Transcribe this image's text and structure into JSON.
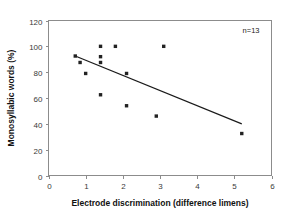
{
  "chart_data": {
    "type": "scatter",
    "title": "",
    "xlabel": "Electrode discrimination (difference limens)",
    "ylabel": "Monosyllabic words (%)",
    "xlim": [
      0,
      6
    ],
    "ylim": [
      0,
      120
    ],
    "xticks": [
      0,
      1,
      2,
      3,
      4,
      5,
      6
    ],
    "yticks": [
      0,
      20,
      40,
      60,
      80,
      100,
      120
    ],
    "xtick_labels": [
      "0",
      "1",
      "2",
      "3",
      "4",
      "5",
      "6"
    ],
    "ytick_labels": [
      "0",
      "20",
      "40",
      "60",
      "80",
      "100",
      "120"
    ],
    "grid": false,
    "legend": false,
    "marker": "square",
    "marker_color": "#222222",
    "annotations": [
      {
        "text": "n=13",
        "x": 5.45,
        "y": 110
      }
    ],
    "points": [
      {
        "x": 0.72,
        "y": 92.5
      },
      {
        "x": 0.85,
        "y": 87.5
      },
      {
        "x": 1.0,
        "y": 79.0
      },
      {
        "x": 1.4,
        "y": 100.0
      },
      {
        "x": 1.4,
        "y": 92.0
      },
      {
        "x": 1.4,
        "y": 87.5
      },
      {
        "x": 1.4,
        "y": 62.5
      },
      {
        "x": 1.8,
        "y": 100.0
      },
      {
        "x": 2.1,
        "y": 79.0
      },
      {
        "x": 2.1,
        "y": 54.0
      },
      {
        "x": 2.9,
        "y": 46.0
      },
      {
        "x": 3.1,
        "y": 100.0
      },
      {
        "x": 5.2,
        "y": 32.5
      }
    ],
    "trend_line": {
      "x0": 0.72,
      "y0": 92.5,
      "x1": 5.2,
      "y1": 40.0
    }
  },
  "figure": {
    "annotation_label": "n=13",
    "x_axis_title": "Electrode discrimination (difference limens)",
    "y_axis_title": "Monosyllabic words (%)"
  }
}
